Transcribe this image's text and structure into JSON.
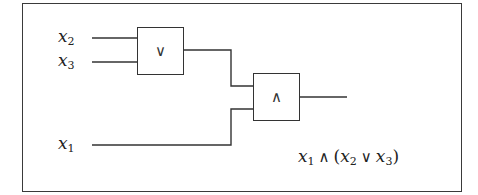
{
  "diagram": {
    "type": "logic-circuit",
    "inputs": [
      {
        "id": "x2",
        "var": "x",
        "sub": "2"
      },
      {
        "id": "x3",
        "var": "x",
        "sub": "3"
      },
      {
        "id": "x1",
        "var": "x",
        "sub": "1"
      }
    ],
    "gates": [
      {
        "id": "or_gate",
        "symbol": "∨",
        "inputs": [
          "x2",
          "x3"
        ]
      },
      {
        "id": "and_gate",
        "symbol": "∧",
        "inputs": [
          "or_gate",
          "x1"
        ]
      }
    ],
    "output_expression": {
      "parts": [
        {
          "var": "x",
          "sub": "1"
        },
        {
          "op": "∧"
        },
        {
          "paren": "("
        },
        {
          "var": "x",
          "sub": "2"
        },
        {
          "op": "∨"
        },
        {
          "var": "x",
          "sub": "3"
        },
        {
          "paren": ")"
        }
      ],
      "text": "x1 ∧ (x2 ∨ x3)"
    },
    "line_color": "#333333"
  }
}
